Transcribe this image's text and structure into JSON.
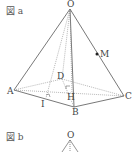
{
  "figures": [
    {
      "label": "図 a",
      "points": {
        "O": {
          "label": "O",
          "x": 70,
          "y": 7
        },
        "A": {
          "label": "A",
          "x": 14,
          "y": 91
        },
        "B": {
          "label": "B",
          "x": 75,
          "y": 107
        },
        "C": {
          "label": "C",
          "x": 124,
          "y": 96
        },
        "D": {
          "label": "D",
          "x": 62,
          "y": 78
        },
        "H": {
          "label": "H",
          "x": 72,
          "y": 93
        },
        "I": {
          "label": "I",
          "x": 44,
          "y": 99
        },
        "M": {
          "label": "M",
          "x": 97,
          "y": 54
        }
      }
    },
    {
      "label": "図 b",
      "points": {
        "O": {
          "label": "O"
        }
      }
    }
  ],
  "colors": {
    "line": "#555555",
    "dotted": "#888888",
    "text": "#444444"
  }
}
